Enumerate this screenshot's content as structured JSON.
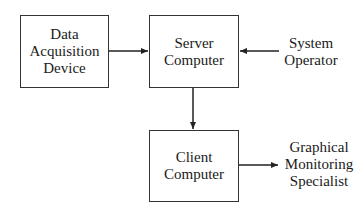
{
  "diagram": {
    "nodes": [
      {
        "id": "data-acquisition-device",
        "lines": [
          "Data",
          "Acquisition",
          "Device"
        ]
      },
      {
        "id": "server-computer",
        "lines": [
          "Server",
          "Computer"
        ]
      },
      {
        "id": "client-computer",
        "lines": [
          "Client",
          "Computer"
        ]
      }
    ],
    "actors": [
      {
        "id": "system-operator",
        "lines": [
          "System",
          "Operator"
        ]
      },
      {
        "id": "graphical-monitoring-specialist",
        "lines": [
          "Graphical",
          "Monitoring",
          "Specialist"
        ]
      }
    ],
    "edges": [
      {
        "from": "data-acquisition-device",
        "to": "server-computer"
      },
      {
        "from": "system-operator",
        "to": "server-computer"
      },
      {
        "from": "server-computer",
        "to": "client-computer"
      },
      {
        "from": "client-computer",
        "to": "graphical-monitoring-specialist"
      }
    ],
    "colors": {
      "stroke": "#333333",
      "text": "#1a1a1a",
      "background": "#ffffff"
    }
  }
}
